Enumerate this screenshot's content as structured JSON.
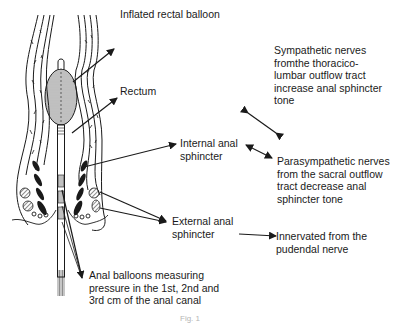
{
  "figure": {
    "labels": {
      "rectal_balloon": "Inflated rectal balloon",
      "rectum": "Rectum",
      "internal_sphincter": "Internal anal\nsphincter",
      "external_sphincter": "External anal\nsphincter",
      "anal_balloons": "Anal balloons measuring\npressure in the 1st, 2nd and\n3rd cm of the anal canal",
      "sympathetic": "Sympathetic nerves\nfromthe thoracico-\nlumbar outflow tract\nincrease anal sphincter\ntone",
      "parasympathetic": "Parasympathetic nerves\nfrom the sacral outflow\ntract decrease anal\nsphincter tone",
      "pudendal": "Innervated from the\npudendal nerve"
    },
    "caption": "Fig. 1"
  },
  "colors": {
    "ink": "#1a1a1a",
    "background": "#ffffff",
    "caption": "#b5b5b5"
  }
}
